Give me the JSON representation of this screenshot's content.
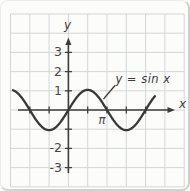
{
  "figure": {
    "y_axis_label": "y",
    "x_axis_label": "x",
    "annotation_text": "y = sin x"
  },
  "chart_data": {
    "type": "line",
    "title": "",
    "xlabel": "x",
    "ylabel": "y",
    "function": "y = sin(x)",
    "annotation": "y = sin x",
    "grid": true,
    "x_domain_rad": [
      -4.51,
      7.09
    ],
    "ylim": [
      -3.5,
      3.5
    ],
    "amplitude": 1,
    "key_points": {
      "x_labels": [
        "-3π/2",
        "-π",
        "-π/2",
        "0",
        "π/2",
        "π",
        "3π/2",
        "2π"
      ],
      "x_rad": [
        -4.712,
        -3.142,
        -1.571,
        0,
        1.571,
        3.142,
        4.712,
        6.283
      ],
      "y": [
        1,
        0,
        -1,
        0,
        1,
        0,
        -1,
        0
      ]
    },
    "x_ticks": [
      {
        "rad": -3.1416,
        "label": ""
      },
      {
        "rad": -1.5708,
        "label": ""
      },
      {
        "rad": 1.5708,
        "label": ""
      },
      {
        "rad": 3.1416,
        "label": "π"
      },
      {
        "rad": 4.7124,
        "label": ""
      },
      {
        "rad": 6.2832,
        "label": ""
      }
    ],
    "y_ticks": [
      {
        "value": 3,
        "label": "3"
      },
      {
        "value": 2,
        "label": "2"
      },
      {
        "value": 1,
        "label": "1"
      },
      {
        "value": -1,
        "label": ""
      },
      {
        "value": -2,
        "label": "-2"
      },
      {
        "value": -3,
        "label": "-3"
      }
    ],
    "colors": {
      "curve": "#383838",
      "axes": "#3d3d3d",
      "grid": "#d3d6d9",
      "labels": "#474747"
    }
  }
}
